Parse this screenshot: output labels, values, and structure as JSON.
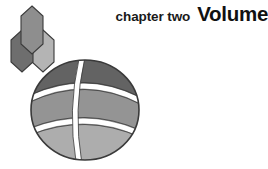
{
  "page": {
    "kind": "book-chapter-opener",
    "background_color": "#ffffff"
  },
  "title": {
    "chapter_label": "chapter two",
    "chapter_title": "Volume",
    "label_color": "#1a1a1a",
    "title_color": "#111111"
  },
  "artwork": {
    "name": "hexagons-and-banded-sphere",
    "description": "Three elongated hexagons in graded grays above a large sphere divided by white latitude and longitude bands.",
    "hexagons": [
      {
        "name": "hexagon-top",
        "tone": "medium",
        "fill": "#8e8e8e"
      },
      {
        "name": "hexagon-left",
        "tone": "dark",
        "fill": "#6e6e6e"
      },
      {
        "name": "hexagon-right",
        "tone": "light",
        "fill": "#b4b4b4"
      }
    ],
    "sphere": {
      "name": "banded-sphere",
      "center_x": 85,
      "center_y": 110,
      "radius": 54,
      "outline": "#3a3a3a",
      "band_line_color": "#ffffff",
      "bands": [
        {
          "name": "top-cap",
          "fill": "#636363"
        },
        {
          "name": "middle-band",
          "fill": "#949494"
        },
        {
          "name": "bottom-band",
          "fill": "#adadad"
        }
      ]
    }
  }
}
